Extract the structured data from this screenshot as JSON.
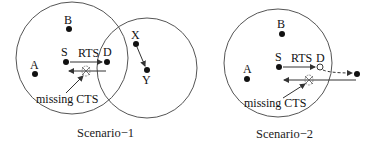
{
  "colors": {
    "line": "#555555",
    "node": "#111111",
    "text": "#111111",
    "background": "#ffffff"
  },
  "scenarios": [
    {
      "caption": "Scenario−1",
      "nodes": {
        "A": "A",
        "B": "B",
        "S": "S",
        "D": "D",
        "X": "X",
        "Y": "Y"
      },
      "rts_label": "RTS",
      "missing_label": "missing CTS"
    },
    {
      "caption": "Scenario−2",
      "nodes": {
        "A": "A",
        "B": "B",
        "S": "S",
        "D": "D"
      },
      "rts_label": "RTS",
      "missing_label": "missing CTS"
    }
  ]
}
